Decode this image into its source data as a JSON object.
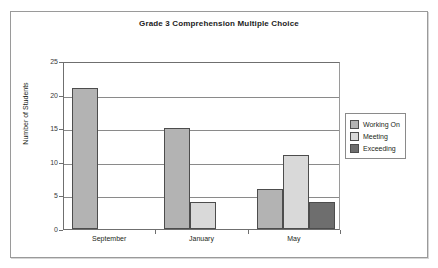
{
  "chart_data": {
    "type": "bar",
    "title": "Grade 3 Comprehension Multiple Choice",
    "xlabel": "",
    "ylabel": "Number of Students",
    "categories": [
      "September",
      "January",
      "May"
    ],
    "ylim": [
      0,
      25
    ],
    "yticks": [
      0,
      5,
      10,
      15,
      20,
      25
    ],
    "grid": true,
    "legend_position": "right",
    "series": [
      {
        "name": "Working On",
        "color": "#b3b3b3",
        "values": [
          21,
          15,
          6
        ]
      },
      {
        "name": "Meeting",
        "color": "#d9d9d9",
        "values": [
          0,
          4,
          11
        ]
      },
      {
        "name": "Exceeding",
        "color": "#6e6e6e",
        "values": [
          0,
          0,
          4
        ]
      }
    ]
  },
  "axis": {
    "y_tick_labels": [
      "25",
      "20",
      "15",
      "10",
      "5",
      "0"
    ],
    "y_title": "Number of Students",
    "x_tick_labels": [
      "September",
      "January",
      "May"
    ]
  },
  "legend": {
    "items": [
      {
        "label": "Working On"
      },
      {
        "label": "Meeting"
      },
      {
        "label": "Exceeding"
      }
    ]
  }
}
